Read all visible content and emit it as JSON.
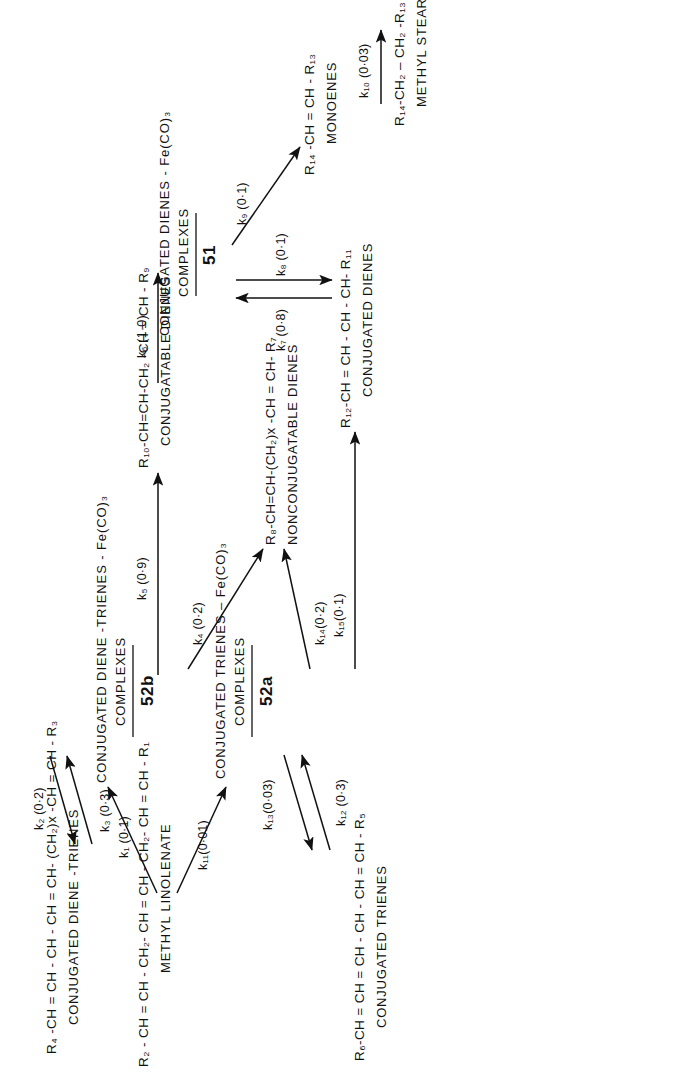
{
  "diagram": {
    "orientation": "rotated-90-ccw",
    "ink_color": "#111111",
    "background_color": "#ffffff"
  },
  "species": {
    "methyl_linolenate": {
      "formula": "R₂ - CH = CH - CH₂- CH = CH - CH₂- CH = CH - R₁",
      "name": "METHYL LINOLENATE"
    },
    "conjugated_diene_trienes": {
      "formula": "R₄ -CH = CH - CH - CH = CH- (CH₂)x -CH = CH - R₃",
      "name": "CONJUGATED DIENE -TRIENES"
    },
    "conjugated_diene_triene_complexes": {
      "name_line1": "CONJUGATED DIENE -TRIENES - Fe(CO)₃",
      "name_line2": "COMPLEXES",
      "label": "52b"
    },
    "conjugated_triene_complexes": {
      "name_line1": "CONJUGATED TRIENES – Fe(CO)₃",
      "name_line2": "COMPLEXES",
      "label": "52a"
    },
    "conjugated_trienes": {
      "formula": "R₆-CH = CH = CH - CH - CH = CH - R₅",
      "name": "CONJUGATED TRIENES"
    },
    "nonconjugatable_dienes": {
      "formula": "R₈-CH=CH-(CH₂)x -CH = CH- R₇",
      "name": "NONCONJUGATABLE DIENES"
    },
    "conjugatable_dienes": {
      "formula": "R₁₀-CH=CH-CH₂ -CH = CH - R₉",
      "name": "CONJUGATABLE DIENES"
    },
    "conjugated_dienes": {
      "formula": "R₁₂-CH = CH - CH - CH- R₁₁",
      "name": "CONJUGATED DIENES"
    },
    "conjugated_diene_complexes": {
      "name_line1": "CONJUGATED DIENES - Fe(CO)₃",
      "name_line2": "COMPLEXES",
      "label": "51"
    },
    "monoenes": {
      "formula": "R₁₄ -CH = CH - R₁₃",
      "name": "MONOENES"
    },
    "methyl_stearate": {
      "formula": "R₁₄-CH₂ – CH₂ -R₁₃",
      "name": "METHYL STEARATE"
    }
  },
  "rate_constants": [
    {
      "id": "k1",
      "label": "k₁ (0·1)"
    },
    {
      "id": "k2",
      "label": "k₂ (0·2)"
    },
    {
      "id": "k3",
      "label": "k₃ (0·3)"
    },
    {
      "id": "k4",
      "label": "k₄ (0·2)"
    },
    {
      "id": "k5",
      "label": "k₅ (0·9)"
    },
    {
      "id": "k6",
      "label": "k₆ (1·0)"
    },
    {
      "id": "k7",
      "label": "k₇ (0·8)"
    },
    {
      "id": "k8",
      "label": "k₈ (0·1)"
    },
    {
      "id": "k9",
      "label": "k₉ (0·1)"
    },
    {
      "id": "k10",
      "label": "k₁₀ (0·03)"
    },
    {
      "id": "k11",
      "label": "k₁₁(0·01)"
    },
    {
      "id": "k12",
      "label": "k₁₂ (0·3)"
    },
    {
      "id": "k13",
      "label": "k₁₃(0·03)"
    },
    {
      "id": "k14",
      "label": "k₁₄(0·2)"
    },
    {
      "id": "k15",
      "label": "k₁₅(0·1)"
    }
  ]
}
